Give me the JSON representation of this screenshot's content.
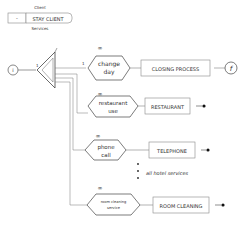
{
  "header": {
    "top_label": "Client",
    "prefix": "-",
    "title": "STAY CLIENT",
    "bottom_label": "Services"
  },
  "start": {
    "label": "i"
  },
  "end": {
    "label": "f"
  },
  "branch_label": "1",
  "branch_label2": "1",
  "multiplicity": "∞",
  "events": [
    {
      "line1": "change",
      "line2": "day",
      "process": "CLOSING PROCESS"
    },
    {
      "line1": "restaurant",
      "line2": "use",
      "process": "RESTAURANT"
    },
    {
      "line1": "phone",
      "line2": "call",
      "process": "TELEPHONE"
    },
    {
      "line1": "room cleaning",
      "line2": "service",
      "process": "ROOM CLEANING"
    }
  ],
  "ellipsis_note": "all hotel services"
}
